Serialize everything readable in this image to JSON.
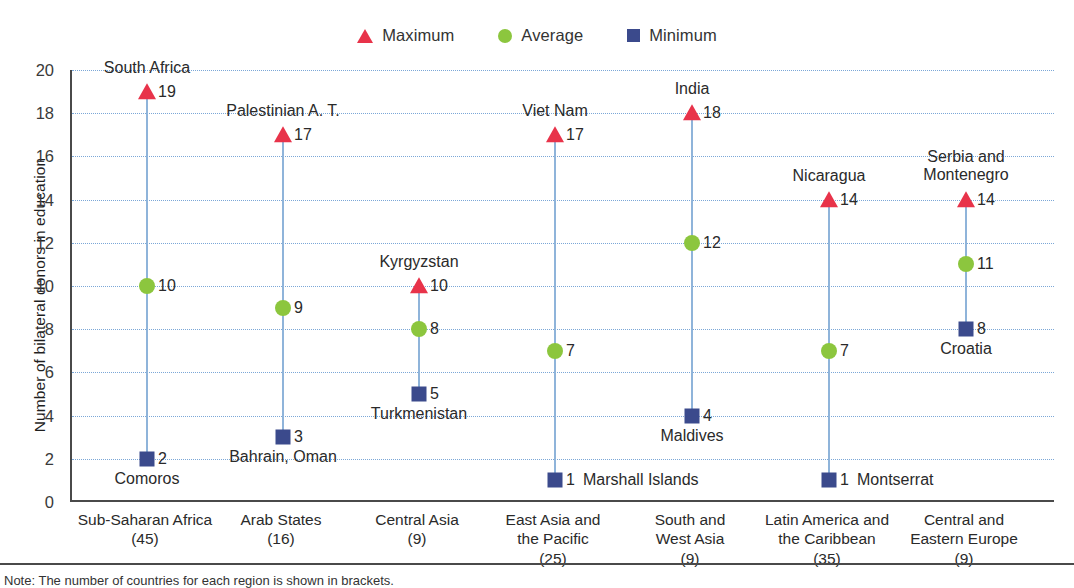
{
  "legend": {
    "items": [
      {
        "label": "Maximum",
        "icon": "triangle-icon",
        "color": "#e8334a"
      },
      {
        "label": "Average",
        "icon": "circle-icon",
        "color": "#8cc63e"
      },
      {
        "label": "Minimum",
        "icon": "square-icon",
        "color": "#3b4a8c"
      }
    ]
  },
  "note": "Note: The number of countries for each region is shown in brackets.",
  "chart_data": {
    "type": "scatter",
    "title": "",
    "xlabel": "",
    "ylabel": "Number of bilateral donors in education",
    "ylim": [
      0,
      20
    ],
    "ytick_step": 2,
    "yticks": [
      "0",
      "2",
      "4",
      "6",
      "8",
      "10",
      "12",
      "14",
      "16",
      "18",
      "20"
    ],
    "grid": true,
    "legend_position": "top-center",
    "categories": [
      "Sub-Saharan Africa",
      "Arab States",
      "Central Asia",
      "East Asia and the Pacific",
      "South and West Asia",
      "Latin America and the Caribbean",
      "Central and Eastern Europe"
    ],
    "category_labels": [
      {
        "line1": "Sub-Saharan Africa",
        "line2": "",
        "count": "(45)"
      },
      {
        "line1": "Arab States",
        "line2": "",
        "count": "(16)"
      },
      {
        "line1": "Central Asia",
        "line2": "",
        "count": "(9)"
      },
      {
        "line1": "East Asia and",
        "line2": "the Pacific",
        "count": "(25)"
      },
      {
        "line1": "South and",
        "line2": "West Asia",
        "count": "(9)"
      },
      {
        "line1": "Latin America and",
        "line2": "the Caribbean",
        "count": "(35)"
      },
      {
        "line1": "Central and",
        "line2": "Eastern Europe",
        "count": "(9)"
      }
    ],
    "series": [
      {
        "name": "Maximum",
        "values": [
          19,
          17,
          10,
          17,
          18,
          14,
          14
        ]
      },
      {
        "name": "Average",
        "values": [
          10,
          9,
          8,
          7,
          12,
          7,
          11
        ]
      },
      {
        "name": "Minimum",
        "values": [
          2,
          3,
          5,
          1,
          4,
          1,
          8
        ]
      }
    ],
    "points": [
      {
        "group": "Sub-Saharan Africa",
        "max": {
          "value": 19,
          "label": "19",
          "country": "South Africa",
          "country_pos": "above"
        },
        "avg": {
          "value": 10,
          "label": "10"
        },
        "min": {
          "value": 2,
          "label": "2",
          "country": "Comoros",
          "country_pos": "below"
        }
      },
      {
        "group": "Arab States",
        "max": {
          "value": 17,
          "label": "17",
          "country": "Palestinian A. T.",
          "country_pos": "above"
        },
        "avg": {
          "value": 9,
          "label": "9"
        },
        "min": {
          "value": 3,
          "label": "3",
          "country": "Bahrain, Oman",
          "country_pos": "below"
        }
      },
      {
        "group": "Central Asia",
        "max": {
          "value": 10,
          "label": "10",
          "country": "Kyrgyzstan",
          "country_pos": "above"
        },
        "avg": {
          "value": 8,
          "label": "8"
        },
        "min": {
          "value": 5,
          "label": "5",
          "country": "Turkmenistan",
          "country_pos": "below"
        }
      },
      {
        "group": "East Asia and the Pacific",
        "max": {
          "value": 17,
          "label": "17",
          "country": "Viet Nam",
          "country_pos": "above"
        },
        "avg": {
          "value": 7,
          "label": "7"
        },
        "min": {
          "value": 1,
          "label": "1",
          "country": "Marshall Islands",
          "country_pos": "inline"
        }
      },
      {
        "group": "South and West Asia",
        "max": {
          "value": 18,
          "label": "18",
          "country": "India",
          "country_pos": "above"
        },
        "avg": {
          "value": 12,
          "label": "12"
        },
        "min": {
          "value": 4,
          "label": "4",
          "country": "Maldives",
          "country_pos": "below"
        }
      },
      {
        "group": "Latin America and the Caribbean",
        "max": {
          "value": 14,
          "label": "14",
          "country": "Nicaragua",
          "country_pos": "above"
        },
        "avg": {
          "value": 7,
          "label": "7"
        },
        "min": {
          "value": 1,
          "label": "1",
          "country": "Montserrat",
          "country_pos": "inline"
        }
      },
      {
        "group": "Central and Eastern Europe",
        "max": {
          "value": 14,
          "label": "14",
          "country": "Serbia and\nMontenegro",
          "country_pos": "above"
        },
        "avg": {
          "value": 11,
          "label": "11"
        },
        "min": {
          "value": 8,
          "label": "8",
          "country": "Croatia",
          "country_pos": "below"
        }
      }
    ]
  }
}
